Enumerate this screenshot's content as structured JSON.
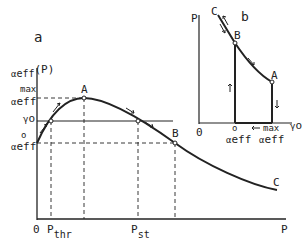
{
  "panel_a": {
    "label": "a",
    "y_axis_label": "α_eff(P)",
    "y_axis_label_greek": "α",
    "y_axis_label_sub": "eff",
    "y_axis_label_arg": "(P)",
    "x_axis_label": "P",
    "origin": "0",
    "ticks_y": {
      "max_sup": "max",
      "max_base": "α",
      "max_sub": "eff",
      "gamma": "γ",
      "gamma_sub": "o",
      "zero_sup": "o",
      "zero_base": "α",
      "zero_sub": "eff"
    },
    "ticks_x": {
      "thr_base": "P",
      "thr_sub": "thr",
      "st_base": "P",
      "st_sub": "st"
    },
    "points": {
      "A": "A",
      "B": "B",
      "C": "C"
    }
  },
  "panel_b": {
    "label": "b",
    "y_axis_label": "P",
    "x_axis_label": "γ",
    "x_axis_label_sub": "o",
    "origin": "0",
    "ticks_x": {
      "zero_sup": "o",
      "zero_base": "α",
      "zero_sub": "eff",
      "max_sup": "max",
      "max_base": "α",
      "max_sub": "eff"
    },
    "points": {
      "A": "A",
      "B": "B",
      "C": "C"
    }
  },
  "colors": {
    "ink": "#222222",
    "background": "#ffffff"
  }
}
